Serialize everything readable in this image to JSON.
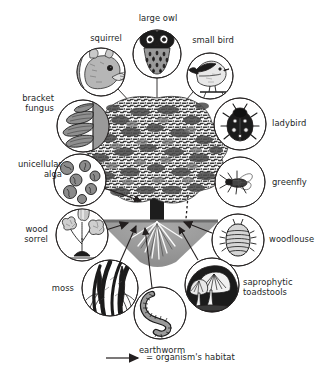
{
  "diagram": {
    "type": "labelled-illustration",
    "legend": {
      "arrow_icon": "arrow-right-icon",
      "text": "= organism's habitat"
    },
    "colors": {
      "ink": "#231f1f",
      "paper": "#ffffff",
      "soil": "#9d9d9d",
      "foliage": "#8a8a8a",
      "fungus_shade": "#8e8e8e"
    },
    "organisms": [
      {
        "id": "squirrel",
        "label": "squirrel",
        "icon": "squirrel-icon",
        "label_align": "center",
        "label_x": 78,
        "label_y": 33,
        "label_w": 56,
        "circle_cx": 101,
        "circle_cy": 72,
        "circle_r": 24,
        "leader": [
          118,
          89,
          145,
          118
        ]
      },
      {
        "id": "large-owl",
        "label": "large owl",
        "icon": "owl-icon",
        "label_align": "center",
        "label_x": 130,
        "label_y": 13,
        "label_w": 56,
        "circle_cx": 157,
        "circle_cy": 54,
        "circle_r": 24,
        "leader": [
          157,
          78,
          157,
          145
        ]
      },
      {
        "id": "small-bird",
        "label": "small bird",
        "icon": "bird-icon",
        "label_align": "center",
        "label_x": 184,
        "label_y": 35,
        "label_w": 58,
        "circle_cx": 210,
        "circle_cy": 76,
        "circle_r": 23,
        "leader": [
          192,
          92,
          166,
          121
        ]
      },
      {
        "id": "ladybird",
        "label": "ladybird",
        "icon": "ladybird-icon",
        "label_align": "left",
        "label_x": 272,
        "label_y": 118,
        "label_w": 56,
        "circle_cx": 240,
        "circle_cy": 124,
        "circle_r": 26,
        "leader": [
          217,
          133,
          197,
          141
        ]
      },
      {
        "id": "greenfly",
        "label": "greenfly",
        "icon": "greenfly-icon",
        "label_align": "left",
        "label_x": 272,
        "label_y": 177,
        "label_w": 56,
        "circle_cx": 240,
        "circle_cy": 182,
        "circle_r": 25,
        "leader": [
          215,
          184,
          200,
          184
        ]
      },
      {
        "id": "woodlouse",
        "label": "woodlouse",
        "icon": "woodlouse-icon",
        "label_align": "left",
        "label_x": 269,
        "label_y": 234,
        "label_w": 60,
        "circle_cx": 238,
        "circle_cy": 240,
        "circle_r": 26,
        "leader": [
          213,
          233,
          180,
          219
        ]
      },
      {
        "id": "saprophytic-toadstools",
        "label": "saprophytic\ntoadstools",
        "icon": "toadstool-icon",
        "label_align": "left",
        "label_x": 243,
        "label_y": 277,
        "label_w": 82,
        "circle_cx": 212,
        "circle_cy": 285,
        "circle_r": 27,
        "leader": [
          199,
          260,
          178,
          222
        ]
      },
      {
        "id": "earthworm",
        "label": "earthworm",
        "icon": "earthworm-icon",
        "label_align": "center",
        "label_x": 131,
        "label_y": 345,
        "label_w": 62,
        "circle_cx": 160,
        "circle_cy": 313,
        "circle_r": 26,
        "leader": [
          152,
          288,
          143,
          222
        ]
      },
      {
        "id": "moss",
        "label": "moss",
        "icon": "moss-icon",
        "label_align": "right",
        "label_x": 38,
        "label_y": 288,
        "label_w": 42,
        "circle_cx": 110,
        "circle_cy": 288,
        "circle_r": 28,
        "leader": [
          120,
          262,
          134,
          220
        ]
      },
      {
        "id": "wood-sorrel",
        "label": "wood\nsorrel",
        "icon": "wood-sorrel-icon",
        "label_align": "right",
        "label_x": 7,
        "label_y": 224,
        "label_w": 45,
        "circle_cx": 82,
        "circle_cy": 235,
        "circle_r": 26,
        "leader": [
          107,
          230,
          125,
          222
        ]
      },
      {
        "id": "unicellular-alga",
        "label": "unicellular\nalga",
        "icon": "alga-icon",
        "label_align": "right",
        "label_x": 3,
        "label_y": 159,
        "label_w": 62,
        "circle_cx": 80,
        "circle_cy": 180,
        "circle_r": 26,
        "leader": [
          104,
          188,
          139,
          200
        ]
      },
      {
        "id": "bracket-fungus",
        "label": "bracket\nfungus",
        "icon": "bracket-fungus-icon",
        "label_align": "right",
        "label_x": 6,
        "label_y": 93,
        "label_w": 50,
        "circle_cx": 83,
        "circle_cy": 126,
        "circle_r": 26,
        "leader": [
          104,
          139,
          137,
          152
        ]
      }
    ]
  }
}
